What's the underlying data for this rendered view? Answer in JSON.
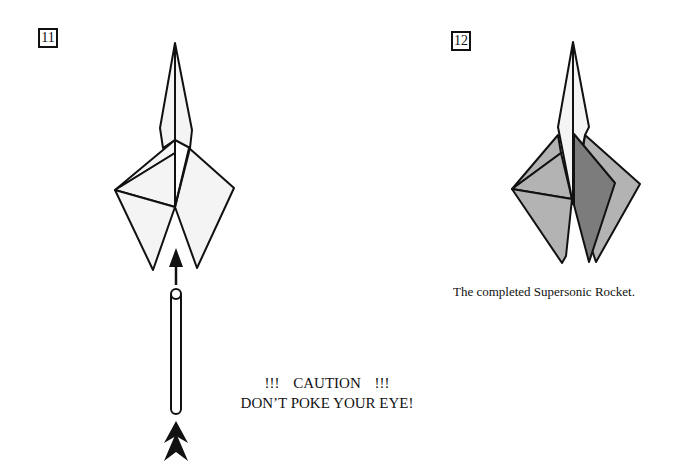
{
  "steps": [
    {
      "number": "11",
      "figure": "rocket-with-pencil-pushing-from-below",
      "caution": {
        "line1": "!!!   CAUTION   !!!",
        "line2": "DON’T POKE YOUR EYE!"
      }
    },
    {
      "number": "12",
      "figure": "completed-rocket-shaded",
      "caption": "The completed Supersonic Rocket."
    }
  ],
  "colors": {
    "line": "#111111",
    "paper_light": "#f4f4f4",
    "paper_mid": "#b3b3b3",
    "paper_dark": "#7c7c7c",
    "background": "#ffffff"
  },
  "icons": {
    "push_arrow": "double-chevron-up",
    "direction_arrow": "arrow-up"
  }
}
